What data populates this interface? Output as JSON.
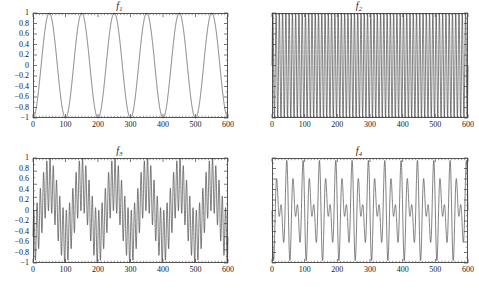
{
  "figure": {
    "background": "#ffffff",
    "line_color": "#3a3a3a",
    "frame_color": "#555555",
    "text_color": "#171717",
    "width": 479,
    "height": 289
  },
  "chart_data": [
    {
      "type": "line",
      "id": "f1",
      "title": "f",
      "title_sub": "1",
      "xlabel": "",
      "ylabel": "",
      "xlim": [
        0,
        600
      ],
      "ylim": [
        -1,
        1
      ],
      "grid": false,
      "legend": "none",
      "xticks": [
        0,
        100,
        200,
        300,
        400,
        500,
        600
      ],
      "xtick_labels": [
        "0",
        "100",
        "200",
        "300",
        "400",
        "500",
        "600"
      ],
      "yticks": [
        1,
        0.8,
        0.6,
        0.4,
        0.2,
        0,
        -0.2,
        -0.4,
        -0.6,
        -0.8,
        -1
      ],
      "ytick_labels": [
        "1",
        "0.8",
        "0.6",
        "0.4",
        "0.2",
        "0",
        "−0.2",
        "−0.4",
        "−0.6",
        "−0.8",
        "−1"
      ],
      "x_minor_count": 10,
      "y_minor_count": 2,
      "formula": {
        "kind": "sine",
        "amplitude": 1,
        "cycles": 6,
        "phase": -1.5707963,
        "offset": 0
      },
      "description": "Low-frequency sine wave, 6 cycles over 0 to 600, amplitude 1"
    },
    {
      "type": "line",
      "id": "f2",
      "title": "f",
      "title_sub": "2",
      "xlabel": "",
      "ylabel": "",
      "xlim": [
        0,
        600
      ],
      "ylim": [
        -1,
        1
      ],
      "grid": false,
      "legend": "none",
      "xticks": [
        0,
        100,
        200,
        300,
        400,
        500,
        600
      ],
      "xtick_labels": [
        "0",
        "100",
        "200",
        "300",
        "400",
        "500",
        "600"
      ],
      "yticks": [
        1,
        0.8,
        0.6,
        0.4,
        0.2,
        0,
        -0.2,
        -0.4,
        -0.6,
        -0.8,
        -1
      ],
      "ytick_labels": [
        "1",
        "0.8",
        "0.6",
        "0.4",
        "0.2",
        "0",
        "−0.2",
        "−0.4",
        "−0.6",
        "−0.8",
        "−1"
      ],
      "x_minor_count": 10,
      "y_minor_count": 2,
      "formula": {
        "kind": "sine",
        "amplitude": 1,
        "cycles": 60,
        "phase": 0,
        "offset": 0
      },
      "description": "High-frequency sine wave, 60 cycles over 0 to 600, amplitude 1"
    },
    {
      "type": "line",
      "id": "f3",
      "title": "f",
      "title_sub": "3",
      "xlabel": "",
      "ylabel": "",
      "xlim": [
        0,
        600
      ],
      "ylim": [
        -2,
        2
      ],
      "grid": false,
      "legend": "none",
      "xticks": [
        0,
        100,
        200,
        300,
        400,
        500,
        600
      ],
      "xtick_labels": [
        "0",
        "100",
        "200",
        "300",
        "400",
        "500",
        "600"
      ],
      "yticks": [
        2,
        1.5,
        1,
        0.5,
        0,
        -0.5,
        -1,
        -1.5,
        -2
      ],
      "ytick_labels": [
        "2",
        "1.5",
        "1",
        "0.5",
        "0",
        "−0.5",
        "−1",
        "−1.5",
        "−2"
      ],
      "x_minor_count": 10,
      "y_minor_count": 2,
      "formula": {
        "kind": "sum",
        "terms": [
          {
            "amplitude": 1,
            "cycles": 6,
            "phase": -1.5707963
          },
          {
            "amplitude": 1,
            "cycles": 60,
            "phase": 0
          }
        ]
      },
      "description": "Sum of low- and high-frequency sine waves, range -2 to 2"
    },
    {
      "type": "line",
      "id": "f4",
      "title": "f",
      "title_sub": "4",
      "xlabel": "",
      "ylabel": "",
      "xlim": [
        0,
        600
      ],
      "ylim": [
        -1,
        1
      ],
      "grid": false,
      "legend": "none",
      "xticks": [
        0,
        100,
        200,
        300,
        400,
        500,
        600
      ],
      "xtick_labels": [
        "0",
        "100",
        "200",
        "300",
        "400",
        "500",
        "600"
      ],
      "yticks": [
        1,
        0.8,
        0.6,
        0.4,
        0.2,
        0,
        -0.2,
        -0.4,
        -0.6,
        -0.8,
        -1
      ],
      "ytick_labels": [
        "1",
        "0.8",
        "0.6",
        "0.4",
        "0.2",
        "0",
        "−0.2",
        "−0.4",
        "−0.6",
        "−0.8",
        "−1"
      ],
      "x_minor_count": 10,
      "y_minor_count": 2,
      "formula": {
        "kind": "product",
        "terms": [
          {
            "amplitude": 1,
            "cycles": 6,
            "phase": -1.5707963
          },
          {
            "amplitude": 1,
            "cycles": 30,
            "phase": 0
          }
        ]
      },
      "description": "Amplitude-modulated signal: product of low- and high-frequency sines, range -1 to 1"
    }
  ]
}
